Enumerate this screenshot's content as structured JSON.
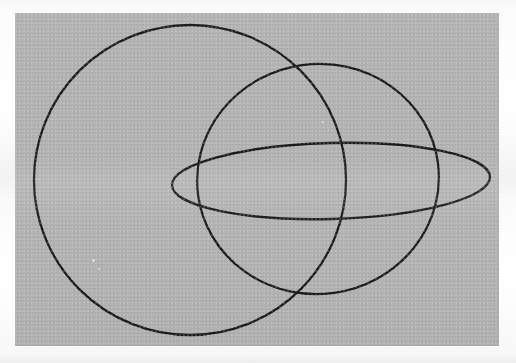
{
  "document": {
    "kind": "scanned-figure",
    "caption": "",
    "background_color": "#ffffff",
    "panel_color": "#b2b2b2",
    "ink_color": "#1b1b1b"
  },
  "panel": {
    "label": "figure-panel",
    "x": 15,
    "y": 13,
    "width": 484,
    "height": 333
  },
  "figure": {
    "title": "",
    "stroke_width": 2.3,
    "shapes": [
      {
        "id": "outer-circle",
        "name": "large-left-circle",
        "type": "ellipse",
        "cx": 175,
        "cy": 167,
        "rx": 156,
        "ry": 155,
        "rotation": 0
      },
      {
        "id": "tilted-circle",
        "name": "right-tilted-circle",
        "type": "ellipse",
        "cx": 303,
        "cy": 166,
        "rx": 121,
        "ry": 115,
        "rotation": -8
      },
      {
        "id": "flat-ellipse",
        "name": "horizontal-flat-ellipse",
        "type": "ellipse",
        "cx": 316,
        "cy": 168,
        "rx": 159,
        "ry": 38,
        "rotation": -1.5
      }
    ]
  },
  "specks": [
    {
      "x": 77,
      "y": 246,
      "size": 3
    },
    {
      "x": 307,
      "y": 108,
      "size": 2
    },
    {
      "x": 83,
      "y": 255,
      "size": 2
    },
    {
      "x": 313,
      "y": 116,
      "size": 1
    }
  ]
}
